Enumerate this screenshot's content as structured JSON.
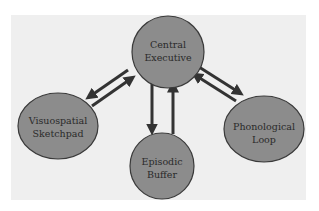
{
  "diagram": {
    "colors": {
      "background": "#ffffff",
      "panel": "#efefef",
      "node_fill": "#8c8c8c",
      "node_stroke": "#3a3a3a",
      "arrow": "#333333",
      "text": "#2a2a2a"
    },
    "nodes": [
      {
        "id": "central-executive",
        "line1": "Central",
        "line2": "Executive",
        "cx": 168,
        "cy": 52,
        "rx": 36,
        "ry": 36
      },
      {
        "id": "visuospatial-sketchpad",
        "line1": "Visuospatial",
        "line2": "Sketchpad",
        "cx": 58,
        "cy": 126,
        "rx": 40,
        "ry": 33
      },
      {
        "id": "phonological-loop",
        "line1": "Phonological",
        "line2": "Loop",
        "cx": 264,
        "cy": 129,
        "rx": 40,
        "ry": 33
      },
      {
        "id": "episodic-buffer",
        "line1": "Episodic",
        "line2": "Buffer",
        "cx": 162,
        "cy": 166,
        "rx": 32,
        "ry": 33
      }
    ],
    "edges": [
      {
        "from": "central-executive",
        "to": "visuospatial-sketchpad"
      },
      {
        "from": "visuospatial-sketchpad",
        "to": "central-executive"
      },
      {
        "from": "central-executive",
        "to": "episodic-buffer"
      },
      {
        "from": "episodic-buffer",
        "to": "central-executive"
      },
      {
        "from": "central-executive",
        "to": "phonological-loop"
      },
      {
        "from": "phonological-loop",
        "to": "central-executive"
      }
    ]
  }
}
